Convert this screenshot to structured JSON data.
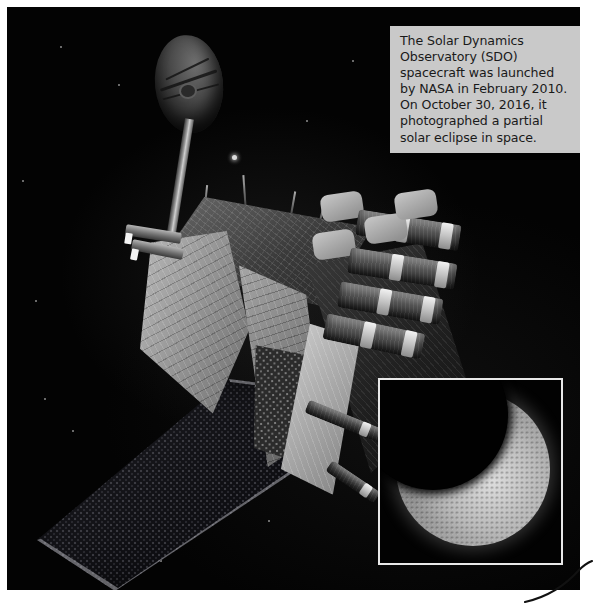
{
  "page": {
    "background_color": "#ffffff",
    "photo": {
      "left": 7,
      "top": 7,
      "width": 573,
      "height": 583,
      "background_color": "#000000",
      "alt_description": "Artist rendering of the Solar Dynamics Observatory spacecraft against black space, with a gold-foil-wrapped bus, a high-gain dish antenna on a boom, four instrument telescope barrels, and a dark solar array wing."
    }
  },
  "caption": {
    "name": "photo-caption",
    "background_color": "#c9c9c9",
    "text_color": "#1a1a1a",
    "lines": [
      "The Solar Dynamics",
      "Observatory (SDO)",
      "spacecraft was launched",
      "by NASA in February 2010.",
      "On October 30, 2016, it",
      "photographed a partial",
      "solar eclipse in space."
    ],
    "full_text": "The Solar Dynamics Observatory (SDO) spacecraft was launched by NASA in February 2010. On October 30, 2016, it photographed a partial solar eclipse in space.",
    "mission_name": "Solar Dynamics Observatory",
    "mission_acronym": "SDO",
    "agency": "NASA",
    "launch_date": "February 2010",
    "eclipse_date": "October 30, 2016"
  },
  "inset": {
    "name": "eclipse-inset-photo",
    "border_color": "#e8e8e8",
    "subject": "partial solar eclipse",
    "description": "Grayscale image of the Sun partially occulted by the Moon, with the dark lunar disk covering the upper-left portion of the solar disk."
  },
  "spacecraft": {
    "parts": [
      {
        "name": "high-gain-antenna-dish",
        "label": "High-gain antenna dish"
      },
      {
        "name": "antenna-boom",
        "label": "Antenna support boom"
      },
      {
        "name": "spacecraft-bus",
        "label": "Foil-wrapped spacecraft bus"
      },
      {
        "name": "instrument-barrel",
        "label": "Instrument telescope barrel"
      },
      {
        "name": "solar-array-wing",
        "label": "Solar array wing"
      },
      {
        "name": "honeycomb-radiator",
        "label": "Honeycomb radiator panel"
      },
      {
        "name": "antenna-horn",
        "label": "Side antenna horn"
      }
    ],
    "instrument_barrel_count": 4
  },
  "stars": [
    {
      "x": 232,
      "y": 155,
      "size": 5,
      "bright": true
    },
    {
      "x": 60,
      "y": 46,
      "size": 2,
      "bright": false
    },
    {
      "x": 118,
      "y": 84,
      "size": 2,
      "bright": false
    },
    {
      "x": 35,
      "y": 300,
      "size": 2,
      "bright": false
    },
    {
      "x": 72,
      "y": 430,
      "size": 2,
      "bright": false
    },
    {
      "x": 95,
      "y": 536,
      "size": 2,
      "bright": false
    },
    {
      "x": 160,
      "y": 560,
      "size": 2,
      "bright": false
    },
    {
      "x": 306,
      "y": 120,
      "size": 2,
      "bright": false
    },
    {
      "x": 352,
      "y": 60,
      "size": 2,
      "bright": false
    },
    {
      "x": 22,
      "y": 180,
      "size": 2,
      "bright": false
    },
    {
      "x": 268,
      "y": 520,
      "size": 2,
      "bright": false
    },
    {
      "x": 200,
      "y": 470,
      "size": 2,
      "bright": false
    },
    {
      "x": 128,
      "y": 490,
      "size": 2,
      "bright": false
    },
    {
      "x": 44,
      "y": 398,
      "size": 2,
      "bright": false
    },
    {
      "x": 340,
      "y": 300,
      "size": 2,
      "bright": false
    }
  ],
  "page_mark": {
    "name": "page-curl-mark",
    "description": "Thin curved pen stroke at the bottom-right corner of the page, outside the photograph.",
    "color": "#111111"
  }
}
